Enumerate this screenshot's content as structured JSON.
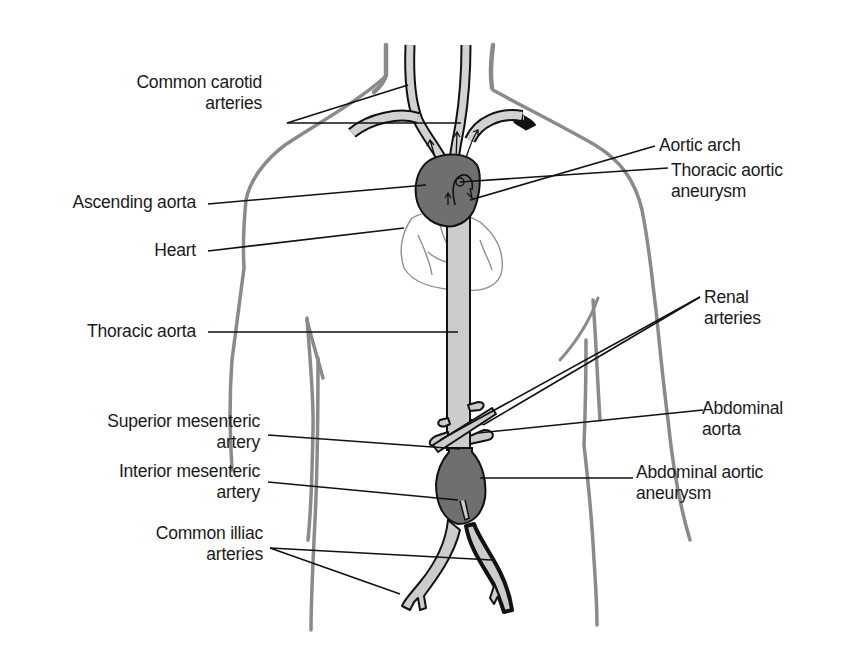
{
  "diagram": {
    "colors": {
      "background": "#ffffff",
      "body_outline": "#8a8a8a",
      "vessel_fill": "#cfcfcf",
      "vessel_outline": "#111111",
      "aneurysm_fill": "#6f6f6f",
      "heart_outline": "#888888",
      "leader_line": "#111111",
      "text": "#1a1a1a"
    },
    "labels_left": [
      {
        "id": "common-carotid-arteries",
        "line1": "Common carotid",
        "line2": "arteries"
      },
      {
        "id": "ascending-aorta",
        "line1": "Ascending aorta",
        "line2": ""
      },
      {
        "id": "heart",
        "line1": "Heart",
        "line2": ""
      },
      {
        "id": "thoracic-aorta",
        "line1": "Thoracic aorta",
        "line2": ""
      },
      {
        "id": "superior-mesenteric-artery",
        "line1": "Superior mesenteric",
        "line2": "artery"
      },
      {
        "id": "interior-mesenteric-artery",
        "line1": "Interior mesenteric",
        "line2": "artery"
      },
      {
        "id": "common-illiac-arteries",
        "line1": "Common illiac",
        "line2": "arteries"
      }
    ],
    "labels_right": [
      {
        "id": "aortic-arch",
        "line1": "Aortic arch",
        "line2": ""
      },
      {
        "id": "thoracic-aortic-aneurysm",
        "line1": "Thoracic aortic",
        "line2": "aneurysm"
      },
      {
        "id": "renal-arteries",
        "line1": "Renal",
        "line2": "arteries"
      },
      {
        "id": "abdominal-aorta",
        "line1": "Abdominal",
        "line2": "aorta"
      },
      {
        "id": "abdominal-aortic-aneurysm",
        "line1": "Abdominal aortic",
        "line2": "aneurysm"
      }
    ]
  }
}
